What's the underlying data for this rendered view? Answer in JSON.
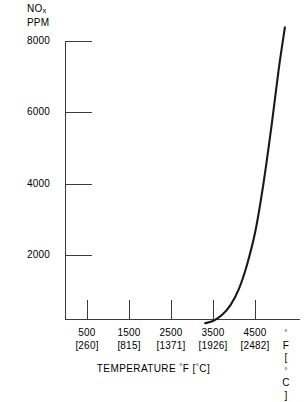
{
  "chart_data": {
    "type": "line",
    "title": "",
    "ylabel": "NOx PPM",
    "ylabel_main": "NO",
    "ylabel_sub": "x",
    "ylabel_unit": "PPM",
    "xlabel": "TEMPERATURE °F [°C]",
    "xlabel_text": "TEMPERATURE",
    "xlabel_unit_f": "F",
    "xlabel_unit_c": "C",
    "x_unit_label_f": "F",
    "x_unit_label_c": "C",
    "ylim": [
      0,
      8000
    ],
    "xlim_f": [
      0,
      5200
    ],
    "grid": false,
    "legend": "none",
    "y_ticks": [
      {
        "value": 8000,
        "label": "8000"
      },
      {
        "value": 6000,
        "label": "6000"
      },
      {
        "value": 4000,
        "label": "4000"
      },
      {
        "value": 2000,
        "label": "2000"
      }
    ],
    "x_ticks": [
      {
        "fahrenheit": 500,
        "celsius": 260,
        "label_f": "500",
        "label_c": "[260]"
      },
      {
        "fahrenheit": 1500,
        "celsius": 815,
        "label_f": "1500",
        "label_c": "[815]"
      },
      {
        "fahrenheit": 2500,
        "celsius": 1371,
        "label_f": "2500",
        "label_c": "[1371]"
      },
      {
        "fahrenheit": 3500,
        "celsius": 1926,
        "label_f": "3500",
        "label_c": "[1926]"
      },
      {
        "fahrenheit": 4500,
        "celsius": 2482,
        "label_f": "4500",
        "label_c": "[2482]"
      }
    ],
    "series": [
      {
        "name": "NOx formation",
        "points": [
          {
            "x_f": 3300,
            "y": 100
          },
          {
            "x_f": 3500,
            "y": 170
          },
          {
            "x_f": 3700,
            "y": 330
          },
          {
            "x_f": 3900,
            "y": 600
          },
          {
            "x_f": 4100,
            "y": 1050
          },
          {
            "x_f": 4300,
            "y": 1750
          },
          {
            "x_f": 4500,
            "y": 2700
          },
          {
            "x_f": 4700,
            "y": 4100
          },
          {
            "x_f": 4900,
            "y": 5800
          },
          {
            "x_f": 5050,
            "y": 7200
          },
          {
            "x_f": 5200,
            "y": 8400
          }
        ]
      }
    ],
    "colors": {
      "curve": "#1a1a1a",
      "axis": "#555555",
      "background": "#ffffff",
      "text": "#000000"
    }
  }
}
